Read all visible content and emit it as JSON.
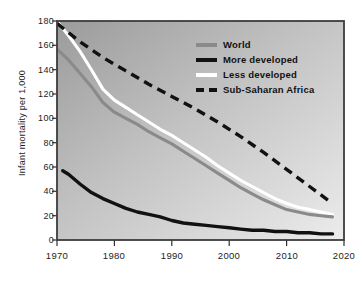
{
  "chart_data": {
    "type": "line",
    "title": "",
    "subtitle": "",
    "xlabel": "",
    "ylabel": "Infant mortality per 1,000",
    "xlim": [
      1970,
      2020
    ],
    "ylim": [
      0,
      180
    ],
    "grid": false,
    "legend_position": "upper-right",
    "x_ticks": [
      1970,
      1980,
      1990,
      2000,
      2010,
      2020
    ],
    "x_tick_labels": [
      "1970",
      "1980",
      "1990",
      "2000",
      "2010",
      "2020"
    ],
    "y_ticks": [
      0,
      20,
      40,
      60,
      80,
      100,
      120,
      140,
      160,
      180
    ],
    "y_tick_labels": [
      "0",
      "20",
      "40",
      "60",
      "80",
      "100",
      "120",
      "140",
      "160",
      "180"
    ],
    "series": [
      {
        "name": "World",
        "color": "#8a8a8a",
        "style": "solid",
        "x": [
          1970,
          1972,
          1974,
          1976,
          1978,
          1980,
          1982,
          1984,
          1986,
          1988,
          1990,
          1992,
          1994,
          1996,
          1998,
          2000,
          2002,
          2004,
          2006,
          2008,
          2010,
          2012,
          2014,
          2016,
          2018
        ],
        "values": [
          157,
          148,
          137,
          126,
          113,
          105,
          100,
          95,
          89,
          84,
          79,
          73,
          67,
          61,
          55,
          49,
          43,
          38,
          33,
          29,
          25,
          23,
          21,
          20,
          19
        ]
      },
      {
        "name": "More developed",
        "color": "#111111",
        "style": "solid",
        "x": [
          1971,
          1972,
          1974,
          1976,
          1978,
          1980,
          1982,
          1984,
          1986,
          1988,
          1990,
          1992,
          1994,
          1996,
          1998,
          2000,
          2002,
          2004,
          2006,
          2008,
          2010,
          2012,
          2014,
          2016,
          2018
        ],
        "values": [
          57,
          54,
          46,
          39,
          34,
          30,
          26,
          23,
          21,
          19,
          16,
          14,
          13,
          12,
          11,
          10,
          9,
          8,
          8,
          7,
          7,
          6,
          6,
          5,
          5
        ]
      },
      {
        "name": "Less developed",
        "color": "#ffffff",
        "style": "solid",
        "x": [
          1970,
          1972,
          1974,
          1976,
          1978,
          1980,
          1982,
          1984,
          1986,
          1988,
          1990,
          1992,
          1994,
          1996,
          1998,
          2000,
          2002,
          2004,
          2006,
          2008,
          2010,
          2012,
          2014,
          2016,
          2018
        ],
        "values": [
          180,
          168,
          155,
          140,
          124,
          115,
          109,
          103,
          97,
          91,
          86,
          80,
          74,
          68,
          61,
          55,
          49,
          44,
          39,
          34,
          30,
          27,
          25,
          23,
          21
        ]
      },
      {
        "name": "Sub-Saharan Africa",
        "color": "#111111",
        "style": "dashed",
        "x": [
          1970,
          1974,
          1978,
          1982,
          1986,
          1990,
          1994,
          1998,
          2002,
          2006,
          2010,
          2014,
          2018
        ],
        "values": [
          178,
          163,
          150,
          139,
          128,
          118,
          108,
          97,
          85,
          72,
          58,
          44,
          30
        ]
      }
    ],
    "legend": [
      {
        "label": "World",
        "color": "#8a8a8a",
        "style": "solid"
      },
      {
        "label": "More developed",
        "color": "#111111",
        "style": "solid"
      },
      {
        "label": "Less developed",
        "color": "#ffffff",
        "style": "solid"
      },
      {
        "label": "Sub-Saharan Africa",
        "color": "#111111",
        "style": "dashed"
      }
    ],
    "plot_background": {
      "top_left": "#9c9c9c",
      "bottom_right": "#e9e9e9"
    },
    "frame_color": "#3c3c3c"
  }
}
